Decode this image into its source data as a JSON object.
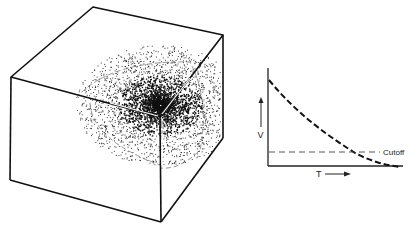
{
  "figure": {
    "left_panel": {
      "description": "Cube with a scattered cloud of points concentrated at one corner, bounded by dashed spherical shells",
      "cube": {
        "top_back": [
          93,
          7
        ],
        "top_left": [
          11,
          77
        ],
        "top_right": [
          223,
          35
        ],
        "top_front": [
          160,
          117
        ],
        "bottom_left": [
          10,
          180
        ],
        "bottom_front": [
          161,
          222
        ],
        "bottom_right": [
          223,
          138
        ]
      },
      "point_cloud_center": [
        160,
        117
      ]
    },
    "right_panel": {
      "y_axis_label": "V",
      "x_axis_label": "T",
      "cutoff_label": "Cutoff",
      "curve_style": "dashed-decay"
    }
  },
  "chart_data": {
    "type": "line",
    "title": "",
    "xlabel": "T",
    "ylabel": "V",
    "grid": false,
    "series": [
      {
        "name": "V vs T (decay)",
        "style": "heavy-dashed",
        "x": [
          0,
          0.1,
          0.2,
          0.3,
          0.4,
          0.5,
          0.6,
          0.7,
          0.8,
          0.9,
          1.0
        ],
        "values": [
          1.0,
          0.82,
          0.66,
          0.53,
          0.42,
          0.32,
          0.24,
          0.17,
          0.11,
          0.05,
          0.0
        ]
      },
      {
        "name": "Cutoff",
        "style": "light-dashed",
        "x": [
          0,
          0.7
        ],
        "values": [
          0.15,
          0.15
        ]
      }
    ],
    "annotations": [
      "Cutoff"
    ],
    "ticks": "none"
  }
}
